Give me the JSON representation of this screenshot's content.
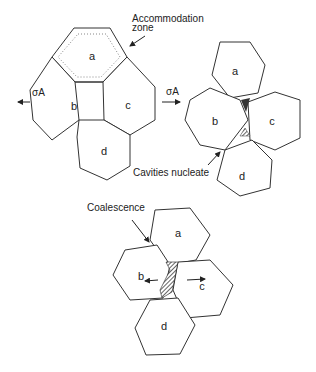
{
  "panel1": {
    "grains": [
      "a",
      "b",
      "c",
      "d"
    ],
    "annotation": "Accommodation",
    "annotation2": "zone",
    "stress_left": "σA"
  },
  "panel2": {
    "grains": [
      "a",
      "b",
      "c",
      "d"
    ],
    "stress_arrow": "σA",
    "annotation": "Cavities nucleate"
  },
  "panel3": {
    "grains": [
      "a",
      "b",
      "c",
      "d"
    ],
    "annotation": "Coalescence"
  }
}
